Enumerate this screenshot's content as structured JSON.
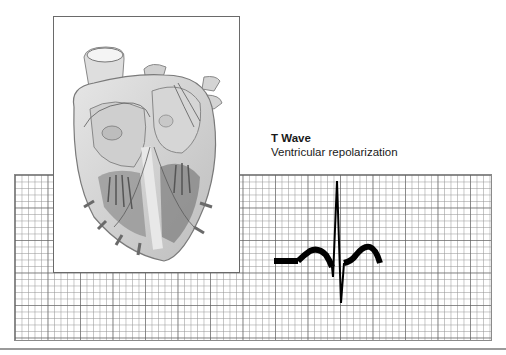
{
  "diagram": {
    "label": {
      "title": "T Wave",
      "description": "Ventricular repolarization"
    },
    "illustration": {
      "name": "heart-cross-section",
      "style": "grayscale anatomical drawing"
    },
    "ecg": {
      "highlighted_segment": "T wave",
      "trace_color": "#000000",
      "grid_color": "#8a8a8a"
    }
  }
}
